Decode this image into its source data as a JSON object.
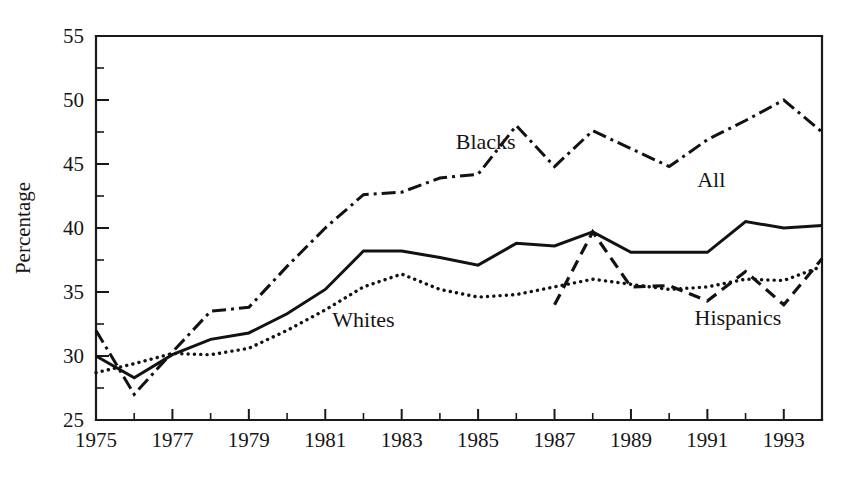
{
  "chart_data": {
    "type": "line",
    "title": "",
    "xlabel": "",
    "ylabel": "Percentage",
    "xlim": [
      1975,
      1994
    ],
    "ylim": [
      25,
      55
    ],
    "grid": false,
    "legend_position": "inline-annotations",
    "y_ticks_major": [
      25,
      30,
      35,
      40,
      45,
      50,
      55
    ],
    "y_ticks_minor": [
      27.5,
      32.5,
      37.5,
      42.5,
      47.5,
      52.5
    ],
    "x_ticks_labeled": [
      1975,
      1977,
      1979,
      1981,
      1983,
      1985,
      1987,
      1989,
      1991,
      1993
    ],
    "x_ticks_all": [
      1975,
      1976,
      1977,
      1978,
      1979,
      1980,
      1981,
      1982,
      1983,
      1984,
      1985,
      1986,
      1987,
      1988,
      1989,
      1990,
      1991,
      1992,
      1993,
      1994
    ],
    "x": [
      1975,
      1976,
      1977,
      1978,
      1979,
      1980,
      1981,
      1982,
      1983,
      1984,
      1985,
      1986,
      1987,
      1988,
      1989,
      1990,
      1991,
      1992,
      1993,
      1994
    ],
    "series": [
      {
        "name": "All",
        "style": "solid",
        "label_x": 1991.1,
        "label_y": 43.2,
        "x": [
          1975,
          1976,
          1977,
          1978,
          1979,
          1980,
          1981,
          1982,
          1983,
          1984,
          1985,
          1986,
          1987,
          1988,
          1989,
          1990,
          1991,
          1992,
          1993,
          1994
        ],
        "values": [
          30.0,
          28.3,
          30.1,
          31.3,
          31.8,
          33.3,
          35.2,
          38.2,
          38.2,
          37.7,
          37.1,
          38.8,
          38.6,
          39.7,
          38.1,
          38.1,
          38.1,
          40.5,
          40.0,
          40.2
        ]
      },
      {
        "name": "Blacks",
        "style": "dash-dot",
        "label_x": 1985.2,
        "label_y": 46.2,
        "x": [
          1975,
          1976,
          1977,
          1978,
          1979,
          1980,
          1981,
          1982,
          1983,
          1984,
          1985,
          1986,
          1987,
          1988,
          1989,
          1990,
          1991,
          1992,
          1993,
          1994
        ],
        "values": [
          32.0,
          27.0,
          30.3,
          33.5,
          33.8,
          37.0,
          40.0,
          42.6,
          42.8,
          43.9,
          44.2,
          48.0,
          44.8,
          47.6,
          46.2,
          44.8,
          46.9,
          48.4,
          50.0,
          47.5
        ]
      },
      {
        "name": "Whites",
        "style": "dotted",
        "label_x": 1982.0,
        "label_y": 32.3,
        "x": [
          1975,
          1976,
          1977,
          1978,
          1979,
          1980,
          1981,
          1982,
          1983,
          1984,
          1985,
          1986,
          1987,
          1988,
          1989,
          1990,
          1991,
          1992,
          1993,
          1994
        ],
        "values": [
          28.7,
          29.4,
          30.2,
          30.1,
          30.6,
          32.0,
          33.6,
          35.4,
          36.4,
          35.2,
          34.6,
          34.8,
          35.4,
          36.0,
          35.6,
          35.2,
          35.4,
          36.0,
          35.9,
          37.0
        ]
      },
      {
        "name": "Hispanics",
        "style": "dashed",
        "label_x": 1991.8,
        "label_y": 32.4,
        "x": [
          1987,
          1988,
          1989,
          1990,
          1991,
          1992,
          1993,
          1994
        ],
        "values": [
          34.0,
          39.7,
          35.4,
          35.5,
          34.3,
          36.6,
          34.0,
          37.6
        ]
      }
    ]
  },
  "labels": {
    "y_axis_title": "Percentage",
    "series_all": "All",
    "series_blacks": "Blacks",
    "series_whites": "Whites",
    "series_hispanics": "Hispanics"
  },
  "colors": {
    "ink": "#121212",
    "background": "#ffffff"
  }
}
